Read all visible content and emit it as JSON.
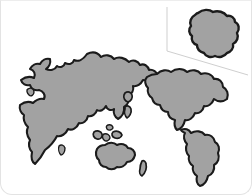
{
  "card": {
    "name": "world-map-card",
    "background_color": "#ffffff",
    "border_color": "#e3e3e3",
    "corner_radius_bottom": "12px"
  },
  "style": {
    "land_fill": "#a2a2a2",
    "land_outline": "#1b1b1b",
    "ocean_fill": "#ffffff",
    "callout_line_color": "#cfcfcf"
  },
  "map": {
    "title": "World Map",
    "projection_note": "stylized world landmasses, no labels",
    "regions": [
      {
        "name": "eurasia-africa",
        "label": "Eurasia and Africa",
        "fill": "#a2a2a2",
        "path": "M 86 53 C 92 50 97 52 100 56 C 104 53 110 54 113 58 C 118 55 124 57 128 61 C 132 58 137 60 139 64 C 143 62 147 65 148 69 C 152 68 156 71 157 75 C 152 78 146 80 142 79 C 140 83 136 86 132 85 C 133 89 131 93 127 95 C 129 99 127 104 123 106 C 124 111 121 116 117 118 C 114 116 112 112 113 108 C 110 110 106 109 105 105 C 103 109 99 111 96 109 C 95 113 91 116 87 115 C 86 120 82 123 78 122 C 76 127 71 130 67 128 C 65 133 60 136 56 135 C 53 141 48 146 44 149 C 41 155 37 160 34 163 C 31 161 30 156 31 151 C 28 148 27 143 29 139 C 26 135 25 130 27 126 C 24 123 22 118 23 114 C 20 112 18 108 19 104 C 23 101 28 100 32 102 C 35 99 39 97 43 98 C 45 94 42 90 38 89 C 34 90 30 88 29 84 C 25 85 21 83 20 79 C 24 76 29 75 33 77 C 35 73 33 69 29 68 C 31 64 35 62 39 63 C 41 59 45 57 49 58 C 50 62 48 66 45 68 C 49 70 54 69 56 65 C 59 67 63 66 64 62 C 68 64 72 63 73 59 C 77 61 82 59 86 53 Z"
      },
      {
        "name": "north-america",
        "label": "North America",
        "fill": "#a2a2a2",
        "path": "M 156 73 C 160 69 166 68 170 71 C 175 67 182 67 186 71 C 191 68 197 69 200 73 C 205 71 211 73 213 78 C 218 77 222 81 222 86 C 226 88 228 93 226 98 C 222 101 217 101 213 98 C 211 103 207 106 203 105 C 202 110 198 113 194 112 C 192 117 188 120 184 119 C 183 124 180 128 176 129 C 174 127 173 123 174 119 C 170 118 167 115 167 111 C 163 111 160 108 159 104 C 155 104 152 101 151 97 C 148 95 146 91 147 87 C 144 84 143 79 146 76 C 149 74 153 73 156 73 Z"
      },
      {
        "name": "south-america",
        "label": "South America",
        "fill": "#a2a2a2",
        "path": "M 180 129 C 184 127 188 128 190 132 C 195 129 201 130 204 134 C 209 133 213 136 214 141 C 218 143 219 148 217 152 C 219 157 217 162 213 164 C 214 169 211 174 207 175 C 206 180 203 184 199 185 C 196 183 195 179 196 175 C 193 173 191 169 192 165 C 189 163 187 159 188 155 C 185 152 184 147 186 143 C 183 140 182 135 184 132 C 182 131 180 130 180 129 Z"
      },
      {
        "name": "australia",
        "label": "Australia",
        "fill": "#a2a2a2",
        "path": "M 104 144 C 108 141 113 141 116 144 C 120 142 125 143 127 147 C 131 147 134 150 134 154 C 133 158 130 161 126 161 C 124 165 120 167 116 166 C 113 169 108 169 105 166 C 101 166 98 163 98 159 C 95 157 94 152 96 148 C 98 145 101 144 104 144 Z"
      },
      {
        "name": "new-zealand",
        "label": "New Zealand",
        "fill": "#a2a2a2",
        "path": "M 141 160 C 143 159 145 161 145 163 C 146 167 144 172 141 175 C 139 174 138 171 139 168 C 139 165 140 162 141 160 Z"
      },
      {
        "name": "greenland-arctic",
        "label": "Northern island",
        "fill": "#a2a2a2",
        "path": "M 124 92 C 127 90 130 91 131 94 C 132 97 130 100 127 101 C 124 100 122 97 123 94 Z"
      },
      {
        "name": "indonesia-island-a",
        "label": "Indonesian island",
        "fill": "#a2a2a2",
        "path": "M 93 131 C 96 129 100 130 101 133 C 102 136 99 139 96 138 C 93 137 91 134 93 131 Z"
      },
      {
        "name": "indonesia-island-b",
        "label": "Indonesian island",
        "fill": "#a2a2a2",
        "path": "M 103 133 C 106 132 109 134 109 137 C 108 140 105 141 103 139 C 101 137 101 134 103 133 Z"
      },
      {
        "name": "indonesia-island-c",
        "label": "Indonesian island",
        "fill": "#a2a2a2",
        "path": "M 112 131 C 116 129 120 131 121 134 C 120 137 117 138 114 137 C 111 136 110 133 112 131 Z"
      },
      {
        "name": "philippines-island",
        "label": "Small island",
        "fill": "#a2a2a2",
        "path": "M 107 124 C 110 123 112 125 112 127 C 111 129 108 130 106 128 C 105 126 105 125 107 124 Z"
      },
      {
        "name": "sri-lanka",
        "label": "Small island",
        "fill": "#a2a2a2",
        "path": "M 58 145 C 60 143 63 144 64 147 C 64 151 62 154 60 154 C 58 152 57 148 58 145 Z"
      },
      {
        "name": "japan-island",
        "label": "Japan",
        "fill": "#a2a2a2",
        "path": "M 124 106 C 126 104 129 105 130 108 C 131 112 128 116 126 117 C 124 115 123 111 124 108 Z"
      },
      {
        "name": "britain-island",
        "label": "British Isles",
        "fill": "#a2a2a2",
        "path": "M 27 88 C 30 86 33 88 33 91 C 33 94 30 96 28 94 C 26 92 25 89 27 88 Z"
      }
    ],
    "inset": {
      "name": "country-detail-inset",
      "label": "Zoomed country detail",
      "fill": "#a2a2a2",
      "path": "M 197 12 C 202 8 208 8 212 11 C 217 9 223 11 226 15 C 230 14 234 17 234 21 C 238 23 239 28 236 32 C 238 36 236 41 232 43 C 233 47 230 51 226 52 C 223 56 218 57 214 55 C 210 57 205 56 203 52 C 199 51 196 48 196 44 C 192 43 190 39 191 35 C 188 33 187 28 190 25 C 188 21 190 16 194 14 C 195 13 196 12 197 12 Z",
      "callout_top_path": "M 166 6 L 166 50 L 247 74",
      "callout_color": "#cfcfcf"
    }
  }
}
